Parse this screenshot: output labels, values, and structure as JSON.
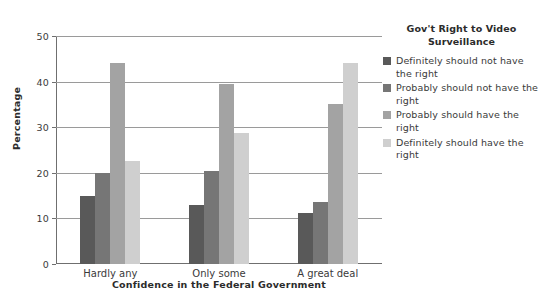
{
  "chart_data": {
    "type": "bar",
    "title": "",
    "categories": [
      "Hardly any",
      "Only some",
      "A great deal"
    ],
    "series": [
      {
        "name": "Definitely should not have the right",
        "color": "#595959",
        "values": [
          15.0,
          13.0,
          11.2
        ]
      },
      {
        "name": "Probably should not have the right",
        "color": "#767676",
        "values": [
          20.0,
          20.3,
          13.7
        ]
      },
      {
        "name": "Probably should have the right",
        "color": "#a3a3a3",
        "values": [
          44.0,
          39.5,
          35.0
        ]
      },
      {
        "name": "Definitely should have the right",
        "color": "#cfcfcf",
        "values": [
          22.5,
          28.8,
          44.0
        ]
      }
    ],
    "xlabel": "Confidence in the Federal Government",
    "ylabel": "Percentage",
    "ylim": [
      0,
      50
    ],
    "yticks": [
      0,
      10,
      20,
      30,
      40,
      50
    ],
    "ytick_labels": [
      "0",
      "10",
      "20",
      "30",
      "40",
      "50"
    ],
    "grid": true,
    "legend_position": "right",
    "legend_title": "Gov't Right to Video Surveillance"
  },
  "legend": {
    "title_line1": "Gov't Right to Video",
    "title_line2": "Surveillance",
    "items": [
      {
        "label": "Definitely should not have the right",
        "color": "#595959"
      },
      {
        "label": "Probably should not have the right",
        "color": "#767676"
      },
      {
        "label": "Probably should have the right",
        "color": "#a3a3a3"
      },
      {
        "label": "Definitely should have the right",
        "color": "#cfcfcf"
      }
    ]
  },
  "axes": {
    "xlabel": "Confidence in the Federal Government",
    "ylabel": "Percentage"
  }
}
